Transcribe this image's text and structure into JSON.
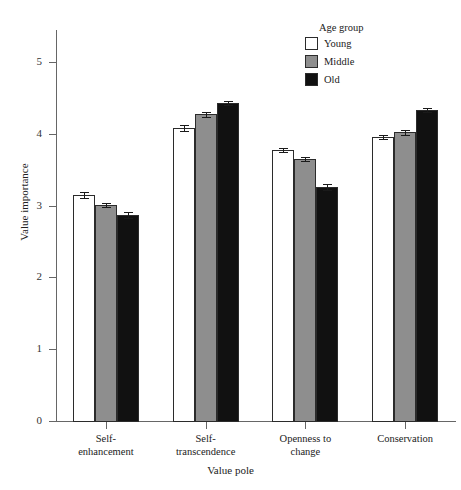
{
  "chart_data": {
    "type": "bar",
    "title": "",
    "subtitle": "",
    "xlabel": "Value pole",
    "ylabel": "Value importance",
    "categories": [
      "Self-enhancement",
      "Self-transcendence",
      "Openness to change",
      "Conservation"
    ],
    "category_lines": [
      [
        "Self-",
        "enhancement"
      ],
      [
        "Self-",
        "transcendence"
      ],
      [
        "Openness to",
        "change"
      ],
      [
        "Conservation",
        ""
      ]
    ],
    "series": [
      {
        "name": "Young",
        "color": "#ffffff",
        "values": [
          3.15,
          4.08,
          3.77,
          3.96
        ],
        "errors": [
          0.04,
          0.04,
          0.03,
          0.03
        ]
      },
      {
        "name": "Middle",
        "color": "#8e8e8e",
        "values": [
          3.01,
          4.27,
          3.65,
          4.02
        ],
        "errors": [
          0.03,
          0.03,
          0.03,
          0.03
        ]
      },
      {
        "name": "Old",
        "color": "#111111",
        "values": [
          2.87,
          4.43,
          3.26,
          4.33
        ],
        "errors": [
          0.04,
          0.03,
          0.04,
          0.03
        ]
      }
    ],
    "ylim": [
      0,
      5.35
    ],
    "yticks": [
      0,
      1,
      2,
      3,
      4,
      5
    ],
    "ytick_labels": [
      "0",
      "1",
      "2",
      "3",
      "4",
      "5"
    ],
    "grid": false,
    "legend_position": "top-right"
  },
  "legend": {
    "title": "Age group",
    "entries": [
      {
        "label": "Young",
        "color": "#ffffff"
      },
      {
        "label": "Middle",
        "color": "#8e8e8e"
      },
      {
        "label": "Old",
        "color": "#111111"
      }
    ]
  },
  "axis": {
    "y_title": "Value importance",
    "x_title": "Value pole"
  }
}
